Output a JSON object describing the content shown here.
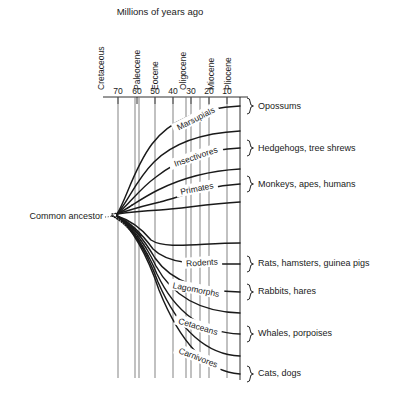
{
  "figure": {
    "axis_title": "Millions of years ago",
    "ancestor_label": "Common ancestor"
  },
  "epochs": [
    {
      "name": "Cretaceous",
      "x": 104
    },
    {
      "name": "Paleocene",
      "x": 140
    },
    {
      "name": "Eocene",
      "x": 158
    },
    {
      "name": "Oligocene",
      "x": 186
    },
    {
      "name": "Miocene",
      "x": 214
    },
    {
      "name": "Pliocene",
      "x": 231
    }
  ],
  "axis": {
    "ticks": [
      {
        "label": "70",
        "x": 118
      },
      {
        "label": "60",
        "x": 137
      },
      {
        "label": "50",
        "x": 155
      },
      {
        "label": "40",
        "x": 173
      },
      {
        "label": "30",
        "x": 191
      },
      {
        "label": "20",
        "x": 209
      },
      {
        "label": "10",
        "x": 227
      }
    ],
    "gridlines_x": [
      118,
      135,
      139,
      155,
      173,
      186,
      191,
      200,
      209,
      227
    ],
    "baseline_y": 97,
    "bottom_y": 378
  },
  "branches": [
    {
      "group": "Marsupials",
      "common_names": "Opossums",
      "labelled": true,
      "terminal_y": 106,
      "label_x": 196,
      "label_y": 119,
      "label_rotate": -27,
      "label_width": 50,
      "brace_y": 106,
      "name_y": 109,
      "path": "M 117 214 C 126 200 134 168 152 144 C 170 120 200 108 240 106"
    },
    {
      "group": "",
      "common_names": "",
      "labelled": false,
      "terminal_y": 131,
      "path": "M 117 214 C 127 203 136 180 154 162 C 174 142 202 133 240 131"
    },
    {
      "group": "Insectivores",
      "common_names": "Hedgehogs, tree shrews",
      "labelled": true,
      "terminal_y": 148,
      "label_x": 196,
      "label_y": 157,
      "label_rotate": -19,
      "label_width": 56,
      "brace_y": 148,
      "name_y": 151,
      "path": "M 117 214 C 128 206 138 190 156 177 C 176 161 203 150 240 148"
    },
    {
      "group": "",
      "common_names": "",
      "labelled": false,
      "terminal_y": 169,
      "path": "M 117 214 C 129 208 140 199 158 190 C 178 180 204 171 240 169"
    },
    {
      "group": "Primates",
      "common_names": "Monkeys, apes, humans",
      "labelled": true,
      "terminal_y": 184,
      "label_x": 197,
      "label_y": 189,
      "label_rotate": -11,
      "label_width": 42,
      "brace_y": 184,
      "name_y": 187,
      "path": "M 117 214 C 130 210 142 206 160 202 C 180 197 205 186 240 184"
    },
    {
      "group": "",
      "common_names": "",
      "labelled": false,
      "terminal_y": 202,
      "path": "M 117 214 C 131 212 143 211 160 210 C 185 208 208 204 240 202"
    },
    {
      "group": "",
      "common_names": "",
      "labelled": false,
      "terminal_y": 243,
      "path": "M 117 216 C 130 220 141 228 151 240 C 166 250 200 243 240 243"
    },
    {
      "group": "Rodents",
      "common_names": "Rats, hamsters, guinea pigs",
      "labelled": true,
      "terminal_y": 264,
      "label_x": 202,
      "label_y": 263,
      "label_rotate": -4,
      "label_width": 40,
      "brace_y": 264,
      "name_y": 266,
      "path": "M 117 216 C 130 222 142 234 153 249 C 170 266 203 264 240 264"
    },
    {
      "group": "Lagomorphs",
      "common_names": "Rabbits, hares",
      "labelled": true,
      "terminal_y": 292,
      "label_x": 196,
      "label_y": 290,
      "label_rotate": 11,
      "label_width": 56,
      "brace_y": 292,
      "name_y": 294,
      "path": "M 117 216 C 130 223 143 238 155 258 C 173 284 204 291 240 292"
    },
    {
      "group": "",
      "common_names": "",
      "labelled": false,
      "terminal_y": 313,
      "path": "M 117 216 C 130 224 144 242 156 266 C 175 301 206 312 240 313"
    },
    {
      "group": "Cetaceans",
      "common_names": "Whales, porpoises",
      "labelled": true,
      "terminal_y": 334,
      "label_x": 198,
      "label_y": 327,
      "label_rotate": 17,
      "label_width": 48,
      "brace_y": 334,
      "name_y": 336,
      "path": "M 117 216 C 130 225 145 246 157 274 C 177 316 207 333 240 334"
    },
    {
      "group": "",
      "common_names": "",
      "labelled": false,
      "terminal_y": 356,
      "path": "M 117 216 C 131 226 146 250 158 282 C 179 331 208 355 240 356"
    },
    {
      "group": "Carnivores",
      "common_names": "Cats, dogs",
      "labelled": true,
      "terminal_y": 374,
      "label_x": 198,
      "label_y": 358,
      "label_rotate": 21,
      "label_width": 50,
      "brace_y": 374,
      "name_y": 376,
      "path": "M 117 216 C 131 227 147 254 159 290 C 181 345 209 372 240 374"
    }
  ],
  "dotted_branches": [
    "M 112 214 C 120 213 126 210 132 205",
    "M 112 216 C 122 219 132 226 141 236",
    "M 112 216 C 124 221 136 233 146 248",
    "M 112 216 C 125 222 138 238 149 258"
  ],
  "terminal_line": {
    "x": 240,
    "y_top": 97,
    "y_bottom": 380
  }
}
